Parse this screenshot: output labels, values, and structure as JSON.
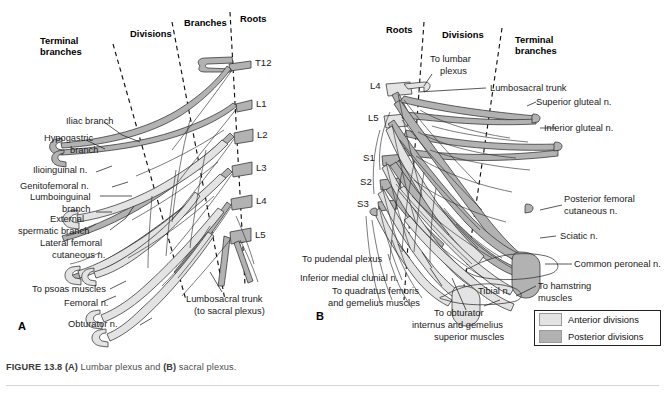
{
  "figure": {
    "caption_prefix": "FIGURE 13.8",
    "caption_a_tag": "(A)",
    "caption_a_text": " Lumbar plexus and ",
    "caption_b_tag": "(B)",
    "caption_b_text": " sacral plexus."
  },
  "panel_a": {
    "letter": "A",
    "zone_labels": [
      {
        "id": "terminal-branches",
        "line1": "Terminal",
        "line2": "branches"
      },
      {
        "id": "divisions",
        "text": "Divisions"
      },
      {
        "id": "branches",
        "text": "Branches"
      },
      {
        "id": "roots",
        "text": "Roots"
      }
    ],
    "roots": [
      "T12",
      "L1",
      "L2",
      "L3",
      "L4",
      "L5"
    ],
    "nerve_labels": [
      {
        "id": "iliac-branch",
        "lines": [
          "Iliac branch"
        ]
      },
      {
        "id": "hypogastric-branch",
        "lines": [
          "Hypogastric",
          "branch"
        ]
      },
      {
        "id": "ilioinguinal-n",
        "lines": [
          "Ilioinguinal n."
        ]
      },
      {
        "id": "genitofemoral-n",
        "lines": [
          "Genitofemoral n."
        ]
      },
      {
        "id": "lumboinguinal-branch",
        "lines": [
          "Lumboinguinal",
          "branch"
        ]
      },
      {
        "id": "external-spermatic-branch",
        "lines": [
          "External",
          "spermatic branch"
        ]
      },
      {
        "id": "lateral-femoral-cutaneous-n",
        "lines": [
          "Lateral femoral",
          "cutaneous n."
        ]
      },
      {
        "id": "to-psoas-muscles",
        "lines": [
          "To psoas muscles"
        ]
      },
      {
        "id": "femoral-n",
        "lines": [
          "Femoral n."
        ]
      },
      {
        "id": "obturator-n",
        "lines": [
          "Obturator n."
        ]
      },
      {
        "id": "lumbosacral-trunk",
        "lines": [
          "Lumbosacral trunk",
          "(to sacral plexus)"
        ]
      }
    ]
  },
  "panel_b": {
    "letter": "B",
    "zone_labels": [
      {
        "id": "roots",
        "text": "Roots"
      },
      {
        "id": "divisions",
        "text": "Divisions"
      },
      {
        "id": "terminal-branches",
        "line1": "Terminal",
        "line2": "branches"
      }
    ],
    "roots": [
      "L4",
      "L5",
      "S1",
      "S2",
      "S3"
    ],
    "nerve_labels": [
      {
        "id": "to-lumbar-plexus",
        "lines": [
          "To lumbar",
          "plexus"
        ]
      },
      {
        "id": "lumbosacral-trunk",
        "lines": [
          "Lumbosacral trunk"
        ]
      },
      {
        "id": "superior-gluteal-n",
        "lines": [
          "Superior gluteal n."
        ]
      },
      {
        "id": "inferior-gluteal-n",
        "lines": [
          "Inferior gluteal n."
        ]
      },
      {
        "id": "posterior-femoral-cutaneous-n",
        "lines": [
          "Posterior femoral",
          "cutaneous n."
        ]
      },
      {
        "id": "sciatic-n",
        "lines": [
          "Sciatic n."
        ]
      },
      {
        "id": "common-peroneal-n",
        "lines": [
          "Common peroneal n."
        ]
      },
      {
        "id": "to-hamstring-muscles",
        "lines": [
          "To hamstring",
          "muscles"
        ]
      },
      {
        "id": "tibial-n",
        "lines": [
          "Tibial n."
        ]
      },
      {
        "id": "to-pudendal-plexus",
        "lines": [
          "To pudendal plexus"
        ]
      },
      {
        "id": "inferior-medial-clunial-n",
        "lines": [
          "Inferior medial clunial n."
        ]
      },
      {
        "id": "to-quadratus-femoris-and-gemelius-muscles",
        "lines": [
          "To quadratus femoris",
          "and gemelius muscles"
        ]
      },
      {
        "id": "to-obturator-internus-and-gemelius-superior-muscles",
        "lines": [
          "To obturator",
          "internus and gemelius",
          "superior muscles"
        ]
      }
    ]
  },
  "legend": {
    "rows": [
      {
        "id": "anterior-divisions",
        "label": "Anterior divisions",
        "color": "#e3e3e3"
      },
      {
        "id": "posterior-divisions",
        "label": "Posterior divisions",
        "color": "#b2b2b2"
      }
    ]
  },
  "colors": {
    "anterior": "#e3e3e3",
    "posterior": "#b2b2b2",
    "outline": "#2a2a2a",
    "caption_text": "#4c4c4c",
    "rule": "#d2d7db"
  }
}
